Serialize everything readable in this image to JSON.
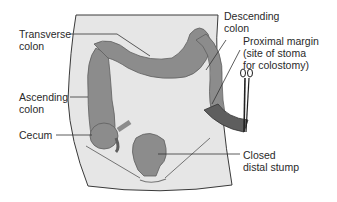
{
  "diagram": {
    "colors": {
      "skin": "#e6e6e6",
      "colon": "#8c8c8c",
      "colon_dark": "#5e5e5e",
      "outline": "#3a3a3a",
      "text": "#2a2a2a",
      "leader": "#333333"
    },
    "labels": {
      "transverse_colon": "Transverse\ncolon",
      "ascending_colon": "Ascending\ncolon",
      "cecum": "Cecum",
      "descending_colon": "Descending\ncolon",
      "proximal_margin": "Proximal margin\n(site of stoma\nfor colostomy)",
      "closed_distal_stump": "Closed\ndistal stump"
    }
  }
}
